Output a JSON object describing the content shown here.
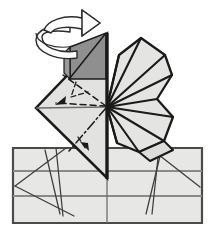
{
  "figure": {
    "title": "Origami folding step diagram",
    "type": "line-diagram"
  },
  "colors": {
    "background": "#ffffff",
    "paper_light": "#e7e7e5",
    "paper_mid": "#dcdcda",
    "paper_shadow": "#8f8f8f",
    "ink": "#1a1a1a",
    "crease_gray": "#6e6e6e",
    "grid_gray": "#8a8a8a",
    "arrow_fill": "#fbfbfb",
    "arrow_stroke": "#2b2b2b",
    "base_border": "#4a4a4a"
  },
  "parts": {
    "base_sheet": {
      "name": "base-sheet",
      "points": "13,148 202,148 202,223 13,223",
      "fill": "#e7e7e5",
      "stroke": "#4a4a4a",
      "stroke_width": 2.2
    },
    "base_grid_horizontals": [
      {
        "y": 171,
        "x1": 13,
        "x2": 202,
        "color": "#8a8a8a",
        "width": 1.8
      },
      {
        "y": 196,
        "x1": 13,
        "x2": 202,
        "color": "#8a8a8a",
        "width": 1.8
      }
    ],
    "base_grid_vertical": {
      "x": 107,
      "y1": 148,
      "y2": 223,
      "color": "#6e6e6e",
      "width": 1.2
    },
    "base_creases": [
      {
        "name": "crease-left-outer",
        "x1": 16,
        "x2": 64,
        "y1": 185,
        "y2": 148
      },
      {
        "name": "crease-left-long",
        "x1": 16,
        "x2": 72,
        "y1": 185,
        "y2": 215
      },
      {
        "name": "crease-left-steep",
        "x1": 55,
        "x2": 62,
        "y1": 148,
        "y2": 215
      },
      {
        "name": "crease-left-steep-b",
        "x1": 44,
        "x2": 59,
        "y1": 148,
        "y2": 213
      },
      {
        "name": "crease-right-steep",
        "x1": 152,
        "x2": 158,
        "y1": 212,
        "y2": 148
      },
      {
        "name": "crease-right-steep-b",
        "x1": 147,
        "x2": 160,
        "y1": 213,
        "y2": 152
      },
      {
        "name": "crease-right-outer",
        "x1": 199,
        "x2": 150,
        "y1": 186,
        "y2": 148
      },
      {
        "name": "crease-center-left-fan",
        "x1": 107,
        "x2": 72,
        "y1": 215,
        "y2": 215
      }
    ],
    "left_kite": {
      "name": "left-kite-flap",
      "points": "107,34 107,178 37,108",
      "fill": "#e2e2e0",
      "stroke": "#1a1a1a",
      "stroke_width": 2.4
    },
    "left_kite_lower": {
      "name": "left-kite-lower-panel",
      "points": "107,107 107,178 37,108",
      "fill": "#dcdcda",
      "stroke": "#1a1a1a",
      "stroke_width": 2.4
    },
    "dark_triangle": {
      "name": "shaded-back-triangle",
      "points": "107,34 107,78 71,78 71,48",
      "fill": "#8f8f8f",
      "stroke": "#1a1a1a",
      "stroke_width": 1.6
    },
    "dark_triangle_diagonal": {
      "x1": 107,
      "y1": 34,
      "x2": 71,
      "y2": 78
    },
    "vertical_spine": {
      "name": "vertical-center-spine",
      "x": 107,
      "y1": 34,
      "y2": 178,
      "color": "#1a1a1a",
      "width": 3.2
    },
    "center_point": {
      "x": 107,
      "y": 107
    },
    "left_solid_creases": [
      {
        "name": "kite-horizontal-crease",
        "x1": 37,
        "y1": 108,
        "x2": 107,
        "y2": 107,
        "color": "#6e6e6e",
        "width": 1.3
      }
    ],
    "left_dashed_folds": [
      {
        "name": "valley-fold-upper",
        "x1": 107,
        "y1": 107,
        "x2": 64,
        "y2": 76,
        "dash": "6 4"
      },
      {
        "name": "valley-fold-mid",
        "x1": 107,
        "y1": 107,
        "x2": 57,
        "y2": 103,
        "dash": "6 4"
      },
      {
        "name": "valley-fold-branch",
        "x1": 76,
        "y1": 83,
        "x2": 70,
        "y2": 97,
        "dash": "5 3"
      },
      {
        "name": "valley-fold-branch-b",
        "x1": 70,
        "y1": 97,
        "x2": 86,
        "y2": 93,
        "dash": "5 3"
      },
      {
        "name": "mountain-fold-lower",
        "x1": 107,
        "y1": 107,
        "x2": 70,
        "y2": 150,
        "dash": "9 3 2 3"
      }
    ],
    "fold_arrows": [
      {
        "name": "fold-arrow-left",
        "from": [
          70,
          97
        ],
        "to": [
          56,
          104
        ],
        "head": "triangle"
      },
      {
        "name": "fold-arrow-lower",
        "from": [
          80,
          140
        ],
        "to": [
          88,
          148
        ],
        "head": "triangle"
      }
    ],
    "right_fan": {
      "name": "right-pleated-fan",
      "outline": "107,107 120,56 141,39 164,55 171,74 158,99 172,116 165,140 141,151 120,144",
      "fill": "#e2e2e0",
      "stroke": "#1a1a1a",
      "stroke_width": 2.4,
      "spokes": [
        {
          "name": "fan-spoke-1",
          "x2": 120,
          "y2": 56
        },
        {
          "name": "fan-spoke-2",
          "x2": 141,
          "y2": 39
        },
        {
          "name": "fan-spoke-3",
          "x2": 164,
          "y2": 55
        },
        {
          "name": "fan-spoke-4",
          "x2": 171,
          "y2": 74
        },
        {
          "name": "fan-spoke-5",
          "x2": 158,
          "y2": 99
        },
        {
          "name": "fan-spoke-6",
          "x2": 172,
          "y2": 116
        },
        {
          "name": "fan-spoke-7",
          "x2": 165,
          "y2": 140
        },
        {
          "name": "fan-spoke-8",
          "x2": 141,
          "y2": 151
        },
        {
          "name": "fan-spoke-9",
          "x2": 120,
          "y2": 144
        }
      ]
    },
    "rotate_arrow": {
      "name": "rotate-arrow",
      "description": "3D helical spiral arrow wrapping the vertical axis, arrowhead pointing right",
      "fill": "#fbfbfb",
      "stroke": "#2b2b2b",
      "stroke_width": 1.5,
      "body": "M 48,32 C 48,22 66,16 84,20 L 84,12 L 101,25 L 84,38 L 84,30 C 70,27 56,30 56,36 C 56,42 68,47 80,45 L 80,53 C 60,56 42,49 42,40 Z",
      "helix": "M 42,38 C 42,48 60,55 78,52 M 42,38 L 42,44 C 42,54 60,61 78,58 L 78,52"
    }
  }
}
